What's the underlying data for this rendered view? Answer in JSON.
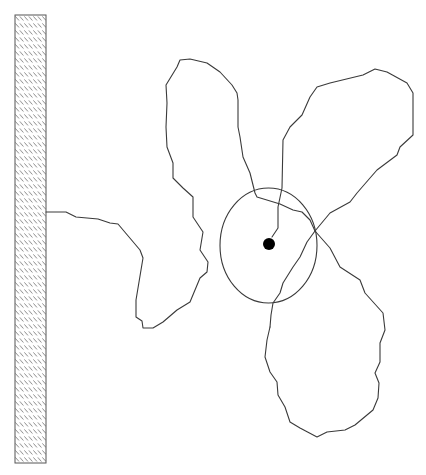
{
  "diagram": {
    "colors": {
      "background": "#ffffff",
      "line": "#3a3a3a",
      "wall_border": "#555555",
      "wall_hatch": "#777777",
      "dot": "#000000"
    },
    "wall": {
      "x": 15,
      "y": 15,
      "width": 31,
      "height": 448,
      "pattern": "diagonal-hatch"
    },
    "home_region": {
      "shape": "ellipse",
      "cx": 268.5,
      "cy": 245.5,
      "rx": 48.5,
      "ry": 57.5
    },
    "home_point": {
      "cx": 269,
      "cy": 244,
      "r": 6
    },
    "paths": {
      "wall_to_left_lobe": "M46,212 L66,212 L76,217 L98,219 L110,223 L118,224 L140,250 L143,258 L136,300 L136,317 L142,321 L143,328 L153,328 L163,322 L177,310 L190,302 L195,290 L200,278 L207,272 L208,262 L200,250 L203,232 L193,217 L193,197 L183,188 L173,178 L173,163 L167,147 L166,127 L167,103 L166,85 L177,67 L180,60 L190,59 L207,63 L220,72 L232,85 L237,93 L238,100 L238,127 L240,137 L243,157 L250,173 L255,193 L257,197 L280,204 L293,210 L302,212 L310,220 L315,231",
      "right_upper_lobe": "M315,231 L330,213 L350,202 L357,193 L370,178 L377,170 L397,155 L400,147 L413,135 L413,93 L407,83 L387,72 L375,69 L363,75 L330,83 L317,87 L310,97 L302,115 L290,127 L283,140 L282,188 L278,207 L278,228 L272,237",
      "lower_lobe": "M315,231 L330,248 L340,267 L360,280 L365,293 L383,313 L385,330 L380,343 L380,362 L375,373 L379,383 L378,398 L373,410 L355,425 L345,430 L327,432 L317,437 L300,428 L290,422 L285,407 L278,395 L277,382 L270,372 L265,357 L267,340 L270,323 L267,350",
      "lower_lobe_inner": "M315,231 L307,242 L300,257 L293,267 L283,283 L280,293 L273,303 L271,315 L270,327"
    }
  }
}
